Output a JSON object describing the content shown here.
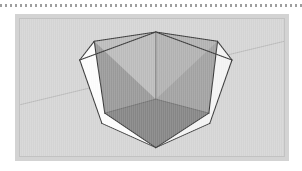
{
  "page": {
    "background_color": "#ffffff",
    "width": 302,
    "height": 171
  },
  "dotted_rule": {
    "label": "dotted separator rule",
    "color": "#8e8e8e",
    "dash_length": 2,
    "gap_length": 3
  },
  "figure": {
    "label": "3d modeling viewport figure",
    "panel_color": "#d3d3d3",
    "frame_color": "#c2c2c2",
    "viewport_background": "#d6d6d6"
  },
  "scene": {
    "label": "cube with tapered pyramidal cavity",
    "horizon": {
      "label": "horizon line",
      "color": "#b6b6b6",
      "x1": 0,
      "y1": 92,
      "x2": 274,
      "y2": 24
    },
    "outline_color": "#3a3a3a",
    "outline_width": 1.1,
    "faces": [
      {
        "name": "top-rim-left",
        "label": "top rim left band",
        "fill": "#bdbdbd",
        "points": "77,24 141,14 141,86 62,44"
      },
      {
        "name": "top-rim-right",
        "label": "top rim right band",
        "fill": "#b3b3b3",
        "points": "141,14 205,24 220,44 141,86"
      },
      {
        "name": "cavity-wall-left",
        "label": "cavity inner wall left",
        "fill": "#9b9b9b",
        "points": "77,24 141,86 141,138 88,101"
      },
      {
        "name": "cavity-wall-right",
        "label": "cavity inner wall right",
        "fill": "#a3a3a3",
        "points": "141,86 205,24 196,101 141,138"
      },
      {
        "name": "cavity-floor",
        "label": "cavity floor",
        "fill": "#878787",
        "points": "141,86 196,101 141,138 88,101"
      },
      {
        "name": "outer-face-left",
        "label": "outer front-left face",
        "fill": "#fdfdfd",
        "points": "77,24 88,101 141,138 85,112"
      },
      {
        "name": "outer-face-right",
        "label": "outer front-right face",
        "fill": "#f4f4f4",
        "points": "205,24 197,112 141,138 196,101"
      }
    ],
    "edges": [
      {
        "name": "top-left-ridge",
        "d": "M 62 44 L 141 14"
      },
      {
        "name": "top-right-ridge",
        "d": "M 141 14 L 220 44"
      },
      {
        "name": "left-vertical",
        "d": "M 62 44 L 85 112"
      },
      {
        "name": "right-vertical",
        "d": "M 220 44 L 197 112"
      },
      {
        "name": "bottom-left",
        "d": "M 85 112 L 141 138"
      },
      {
        "name": "bottom-right",
        "d": "M 141 138 L 197 112"
      },
      {
        "name": "cavity-center-vertical",
        "d": "M 141 14 L 141 86"
      },
      {
        "name": "cavity-taper-left",
        "d": "M 141 86 L 88 101"
      },
      {
        "name": "cavity-taper-right",
        "d": "M 141 86 L 196 101"
      },
      {
        "name": "cavity-floor-left",
        "d": "M 88 101 L 141 138"
      },
      {
        "name": "cavity-floor-right",
        "d": "M 196 101 L 141 138"
      },
      {
        "name": "rim-edge-left",
        "d": "M 62 44 L 77 24"
      },
      {
        "name": "rim-edge-right",
        "d": "M 220 44 L 205 24"
      },
      {
        "name": "cavity-wall-left-edge",
        "d": "M 77 24 L 88 101"
      },
      {
        "name": "cavity-wall-right-edge",
        "d": "M 205 24 L 196 101"
      }
    ]
  }
}
